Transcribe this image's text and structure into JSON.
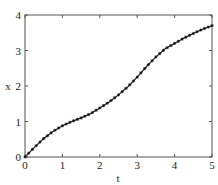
{
  "chart_data": {
    "type": "line",
    "title": "",
    "xlabel": "t",
    "ylabel": "x",
    "xlim": [
      0,
      5
    ],
    "ylim": [
      0,
      4
    ],
    "xticks": [
      "0",
      "1",
      "2",
      "3",
      "4",
      "5"
    ],
    "yticks": [
      "0",
      "1",
      "2",
      "3",
      "4"
    ],
    "grid": false,
    "legend": null,
    "marker": "asterisk",
    "series": [
      {
        "name": "x(t)",
        "color": "#222222",
        "x": [
          0,
          0.25,
          0.5,
          0.75,
          1.0,
          1.25,
          1.5,
          1.75,
          2.0,
          2.25,
          2.5,
          2.75,
          3.0,
          3.25,
          3.5,
          3.75,
          4.0,
          4.25,
          4.5,
          4.75,
          5.0
        ],
        "y": [
          0,
          0.27,
          0.52,
          0.72,
          0.88,
          1.0,
          1.1,
          1.22,
          1.38,
          1.55,
          1.75,
          1.98,
          2.25,
          2.55,
          2.82,
          3.05,
          3.2,
          3.35,
          3.48,
          3.6,
          3.7
        ]
      }
    ]
  }
}
